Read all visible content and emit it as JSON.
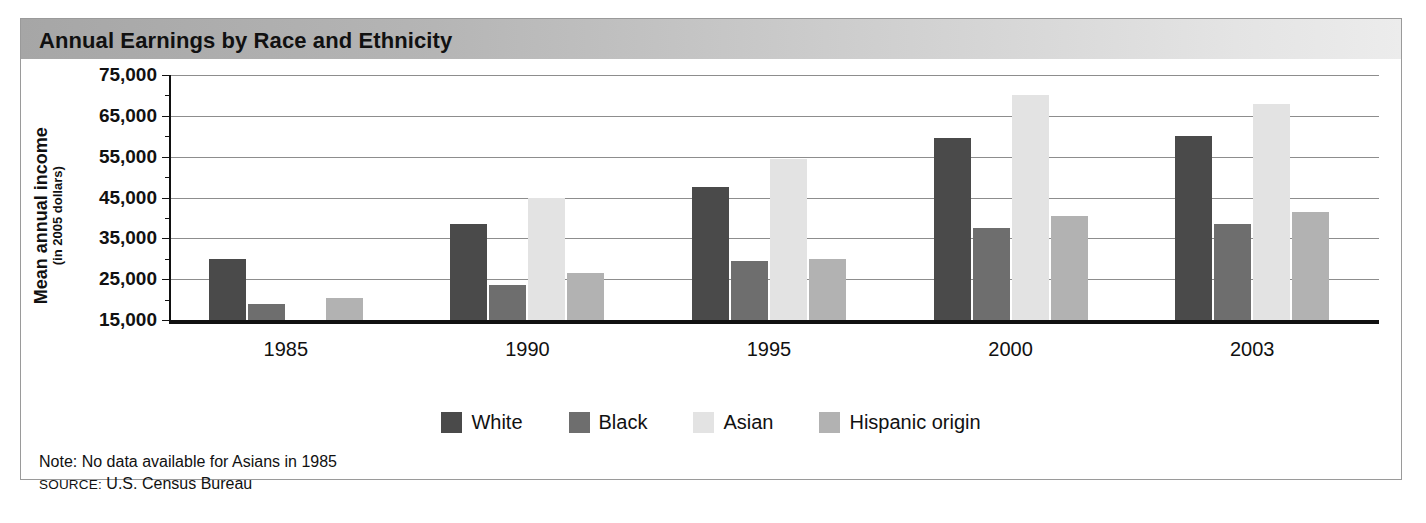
{
  "figure": {
    "title": "Annual Earnings by Race and Ethnicity",
    "note": "Note: No data available for Asians in 1985",
    "source_kicker": "SOURCE:",
    "source_text": " U.S. Census Bureau"
  },
  "axis": {
    "y_title_main": "Mean annual income",
    "y_title_sub": "(in 2005 dollars)",
    "y_ticks": [
      "75,000",
      "65,000",
      "55,000",
      "45,000",
      "35,000",
      "25,000",
      "15,000"
    ]
  },
  "legend": {
    "items": [
      {
        "label": "White",
        "color": "#4a4a4a"
      },
      {
        "label": "Black",
        "color": "#6e6e6e"
      },
      {
        "label": "Asian",
        "color": "#e3e3e3"
      },
      {
        "label": "Hispanic origin",
        "color": "#b2b2b2"
      }
    ]
  },
  "chart_data": {
    "type": "bar",
    "title": "Annual Earnings by Race and Ethnicity",
    "xlabel": "",
    "ylabel": "Mean annual income (in 2005 dollars)",
    "ylim": [
      15000,
      75000
    ],
    "ytick_values": [
      15000,
      25000,
      35000,
      45000,
      55000,
      65000,
      75000
    ],
    "minor_tick_step": 5000,
    "grid": true,
    "legend_position": "bottom",
    "categories": [
      "1985",
      "1990",
      "1995",
      "2000",
      "2003"
    ],
    "series": [
      {
        "name": "White",
        "color": "#4a4a4a",
        "values": [
          30000,
          38500,
          47500,
          59500,
          60000
        ]
      },
      {
        "name": "Black",
        "color": "#6e6e6e",
        "values": [
          19000,
          23500,
          29500,
          37500,
          38500
        ]
      },
      {
        "name": "Asian",
        "color": "#e3e3e3",
        "values": [
          null,
          45000,
          54500,
          70000,
          68000
        ]
      },
      {
        "name": "Hispanic origin",
        "color": "#b2b2b2",
        "values": [
          20500,
          26500,
          30000,
          40500,
          41500
        ]
      }
    ],
    "annotations": [
      "Note: No data available for Asians in 1985",
      "SOURCE: U.S. Census Bureau"
    ]
  }
}
